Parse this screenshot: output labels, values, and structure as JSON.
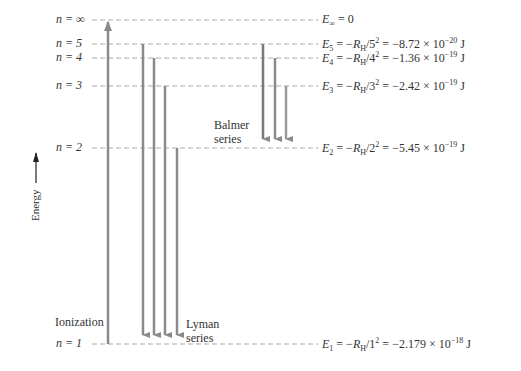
{
  "diagram": {
    "axis_label": "Energy",
    "levels": [
      {
        "n": "∞",
        "label_n": "n = ∞",
        "y": 20,
        "energy_label": "E∞ = 0",
        "sym": "E",
        "sub": "∞",
        "expr": "",
        "value": "0",
        "exp": ""
      },
      {
        "n": "5",
        "label_n": "n = 5",
        "y": 44,
        "energy_label": "E5 = −RH/5² = −8.72 × 10⁻²⁰ J",
        "sym": "E",
        "sub": "5",
        "expr_n": "5",
        "mantissa": "−8.72 × 10",
        "exp": "−20",
        "unit": "J"
      },
      {
        "n": "4",
        "label_n": "n = 4",
        "y": 58,
        "energy_label": "E4 = −RH/4² = −1.36 × 10⁻¹⁹ J",
        "sym": "E",
        "sub": "4",
        "expr_n": "4",
        "mantissa": "−1.36 × 10",
        "exp": "−19",
        "unit": "J"
      },
      {
        "n": "3",
        "label_n": "n = 3",
        "y": 86,
        "energy_label": "E3 = −RH/3² = −2.42 × 10⁻¹⁹ J",
        "sym": "E",
        "sub": "3",
        "expr_n": "3",
        "mantissa": "−2.42 × 10",
        "exp": "−19",
        "unit": "J"
      },
      {
        "n": "2",
        "label_n": "n = 2",
        "y": 148,
        "energy_label": "E2 = −RH/2² = −5.45 × 10⁻¹⁹ J",
        "sym": "E",
        "sub": "2",
        "expr_n": "2",
        "mantissa": "−5.45 × 10",
        "exp": "−19",
        "unit": "J"
      },
      {
        "n": "1",
        "label_n": "n = 1",
        "y": 344,
        "energy_label": "E1 = −RH/1² = −2.179 × 10⁻¹⁸ J",
        "sym": "E",
        "sub": "1",
        "expr_n": "1",
        "mantissa": "−2.179 × 10",
        "exp": "−18",
        "unit": "J"
      }
    ],
    "series": [
      {
        "name": "Ionization",
        "label": "Ionization",
        "transitions": [
          {
            "from": "1",
            "to": "∞",
            "x": 108
          }
        ]
      },
      {
        "name": "Lyman",
        "label_line1": "Lyman",
        "label_line2": "series",
        "transitions": [
          {
            "from": "5",
            "to": "1",
            "x": 143
          },
          {
            "from": "4",
            "to": "1",
            "x": 154
          },
          {
            "from": "3",
            "to": "1",
            "x": 165
          },
          {
            "from": "2",
            "to": "1",
            "x": 177
          }
        ]
      },
      {
        "name": "Balmer",
        "label_line1": "Balmer",
        "label_line2": "series",
        "transitions": [
          {
            "from": "5",
            "to": "2",
            "x": 263
          },
          {
            "from": "4",
            "to": "2",
            "x": 275
          },
          {
            "from": "3",
            "to": "2",
            "x": 286
          }
        ]
      }
    ],
    "colors": {
      "arrow": "#8a8a8a",
      "dash": "#a8a8a8",
      "text": "#333333"
    }
  }
}
